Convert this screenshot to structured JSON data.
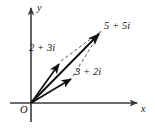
{
  "figure": {
    "kind": "complex-plane-vector-addition-diagram",
    "background_color": "#ffffff",
    "stroke_color": "#1a1a1a",
    "dashed_color": "#555555",
    "axes": {
      "x_label": "x",
      "y_label": "y",
      "origin_label": "O",
      "origin_px": [
        31,
        103
      ],
      "x_axis_from_px": [
        10,
        103
      ],
      "x_axis_to_px": [
        139,
        103
      ],
      "y_axis_from_px": [
        31,
        122
      ],
      "y_axis_to_px": [
        31,
        6
      ]
    },
    "vectors": [
      {
        "name": "addend-a",
        "label": "2 + 3i",
        "real": 2,
        "imaginary": 3,
        "tip_px": [
          61,
          61
        ],
        "style": "solid-arrow"
      },
      {
        "name": "addend-b",
        "label": "3 + 2i",
        "real": 3,
        "imaginary": 2,
        "tip_px": [
          73,
          76
        ],
        "style": "solid-arrow"
      },
      {
        "name": "sum",
        "label": "5 + 5i",
        "real": 5,
        "imaginary": 5,
        "tip_px": [
          102,
          30
        ],
        "style": "solid-arrow"
      }
    ],
    "construction_lines": [
      {
        "name": "parallel-to-addend-b",
        "from_px": [
          61,
          61
        ],
        "to_px": [
          102,
          30
        ],
        "style": "dashed"
      },
      {
        "name": "parallel-to-addend-a",
        "from_px": [
          73,
          76
        ],
        "to_px": [
          102,
          30
        ],
        "style": "dashed"
      }
    ]
  }
}
